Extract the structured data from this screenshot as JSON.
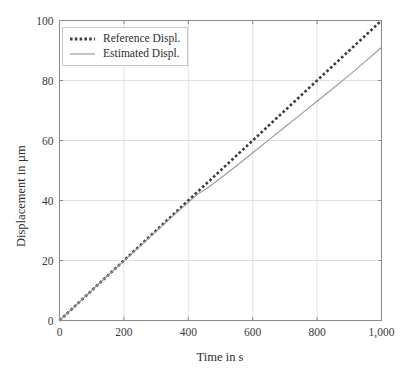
{
  "figure": {
    "clipped_top_text": "",
    "background_color": "#ffffff",
    "grid_color": "#d9d9d9",
    "axis_color": "#8a8a8a",
    "text_color": "#2e2e2e"
  },
  "chart_data": {
    "type": "line",
    "title": "",
    "xlabel": "Time in s",
    "ylabel": "Displacement in µm",
    "xlim": [
      0,
      1000
    ],
    "ylim": [
      0,
      100
    ],
    "xticks": [
      0,
      200,
      400,
      600,
      800,
      1000
    ],
    "xtick_labels": [
      "0",
      "200",
      "400",
      "600",
      "800",
      "1,000"
    ],
    "yticks": [
      0,
      20,
      40,
      60,
      80,
      100
    ],
    "ytick_labels": [
      "0",
      "20",
      "40",
      "60",
      "80",
      "100"
    ],
    "grid": true,
    "legend_position": "upper left",
    "series": [
      {
        "name": "Reference Displ.",
        "style": "dotted",
        "color": "#3f3f3f",
        "width": 2.6,
        "x": [
          0,
          100,
          200,
          300,
          400,
          500,
          600,
          700,
          800,
          900,
          1000
        ],
        "values": [
          0,
          10,
          20,
          30,
          40,
          50,
          60,
          70,
          80,
          90,
          100
        ]
      },
      {
        "name": "Estimated Displ.",
        "style": "solid",
        "color": "#9a9a9a",
        "width": 1.1,
        "x": [
          0,
          50,
          100,
          150,
          200,
          250,
          300,
          350,
          400,
          430,
          450,
          470,
          500,
          550,
          600,
          650,
          700,
          750,
          800,
          850,
          900,
          950,
          1000
        ],
        "values": [
          0,
          5.0,
          10.0,
          15.0,
          19.9,
          24.8,
          29.7,
          34.6,
          39.4,
          42.2,
          43.5,
          45.0,
          47.4,
          51.6,
          55.9,
          60.2,
          64.5,
          68.8,
          73.1,
          77.4,
          81.8,
          86.4,
          91.0
        ]
      }
    ]
  },
  "legend": {
    "items": [
      {
        "label": "Reference Displ."
      },
      {
        "label": "Estimated Displ."
      }
    ]
  }
}
